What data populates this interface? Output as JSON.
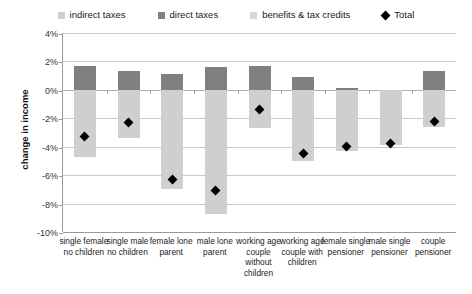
{
  "chart_data": {
    "type": "bar",
    "title": "",
    "xlabel": "",
    "ylabel": "change in income",
    "ylim": [
      -10,
      4
    ],
    "ytick_labels": [
      "4%",
      "2%",
      "0%",
      "-2%",
      "-4%",
      "-6%",
      "-8%",
      "-10%"
    ],
    "ytick_values": [
      4,
      2,
      0,
      -2,
      -4,
      -6,
      -8,
      -10
    ],
    "grid": true,
    "legend_position": "top",
    "stacked": true,
    "categories": [
      "single female no children",
      "single male no children",
      "female lone parent",
      "male lone parent",
      "working age couple without children",
      "working age couple with children",
      "female single pensioner",
      "male single pensioner",
      "couple pensioner"
    ],
    "series": [
      {
        "name": "indirect taxes",
        "color": "#cfcfcf",
        "values": [
          -4.7,
          -3.4,
          -7.0,
          -8.7,
          -2.7,
          -5.0,
          -4.3,
          -3.9,
          -2.6
        ]
      },
      {
        "name": "direct taxes",
        "color": "#808080",
        "values": [
          1.7,
          1.3,
          1.1,
          1.6,
          1.7,
          0.9,
          0.15,
          0.0,
          1.3
        ]
      },
      {
        "name": "benefits & tax credits",
        "color": "#cfcfcf",
        "values": [
          0,
          0,
          0,
          0,
          0,
          0,
          0,
          0,
          0
        ]
      }
    ],
    "total": {
      "name": "Total",
      "marker": "diamond",
      "color": "#000000",
      "values": [
        -3.3,
        -2.3,
        -6.3,
        -7.1,
        -1.4,
        -4.5,
        -4.0,
        -3.8,
        -2.2
      ]
    }
  },
  "legend": {
    "items": [
      {
        "label": "indirect taxes",
        "swatch": "#cfcfcf",
        "shape": "square"
      },
      {
        "label": "direct taxes",
        "swatch": "#808080",
        "shape": "square"
      },
      {
        "label": "benefits & tax credits",
        "swatch": "#d8d8d8",
        "shape": "square"
      },
      {
        "label": "Total",
        "swatch": "#000000",
        "shape": "diamond"
      }
    ]
  }
}
